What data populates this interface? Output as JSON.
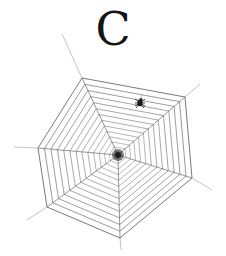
{
  "illustration": {
    "letter": "C",
    "letter_color": "#141414",
    "subject": "spider-web-with-spider"
  },
  "web": {
    "center": [
      118,
      155
    ],
    "outer_vertices": [
      [
        82,
        78
      ],
      [
        185,
        97
      ],
      [
        192,
        178
      ],
      [
        120,
        238
      ],
      [
        47,
        207
      ],
      [
        38,
        148
      ]
    ],
    "anchor_lines": [
      [
        [
          82,
          78
        ],
        [
          62,
          34
        ]
      ],
      [
        [
          185,
          97
        ],
        [
          200,
          84
        ]
      ],
      [
        [
          192,
          178
        ],
        [
          212,
          190
        ]
      ],
      [
        [
          47,
          207
        ],
        [
          27,
          220
        ]
      ],
      [
        [
          38,
          148
        ],
        [
          14,
          147
        ]
      ],
      [
        [
          120,
          238
        ],
        [
          121,
          250
        ]
      ]
    ],
    "ring_count": 14,
    "thread_color": "#6a6a6a",
    "core_color": "#1e1e1e"
  },
  "spider": {
    "position": [
      140,
      103
    ],
    "color": "#1a1a1a",
    "label": "spider"
  }
}
